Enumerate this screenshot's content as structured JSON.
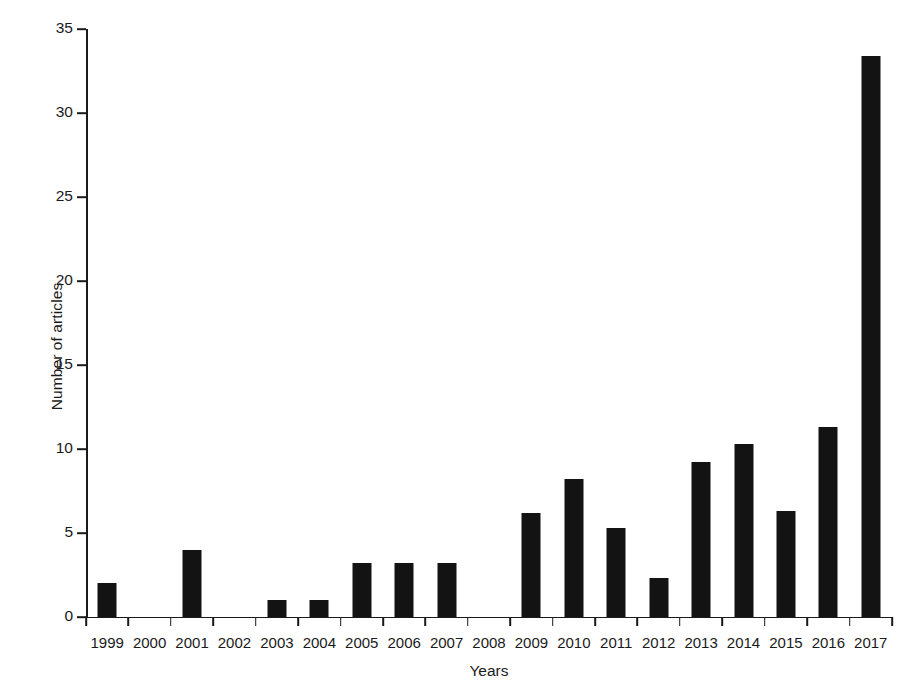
{
  "chart_data": {
    "type": "bar",
    "title": "",
    "xlabel": "Years",
    "ylabel": "Number of articles",
    "categories": [
      "1999",
      "2000",
      "2001",
      "2002",
      "2003",
      "2004",
      "2005",
      "2006",
      "2007",
      "2008",
      "2009",
      "2010",
      "2011",
      "2012",
      "2013",
      "2014",
      "2015",
      "2016",
      "2017"
    ],
    "values": [
      2.0,
      0,
      4.0,
      0,
      1.0,
      1.0,
      3.2,
      3.2,
      3.2,
      0,
      6.2,
      8.2,
      5.3,
      2.3,
      9.2,
      10.3,
      6.3,
      11.3,
      33.4
    ],
    "ylim": [
      0,
      35
    ],
    "ytick_values": [
      0,
      5,
      10,
      15,
      20,
      25,
      30,
      35
    ],
    "ytick_labels": [
      "0",
      "5",
      "10",
      "15",
      "20",
      "25",
      "30",
      "35"
    ],
    "grid": false,
    "legend": "none",
    "bar_color": "#131313",
    "axis_color": "#1a1a1a",
    "background_color": "#ffffff"
  }
}
